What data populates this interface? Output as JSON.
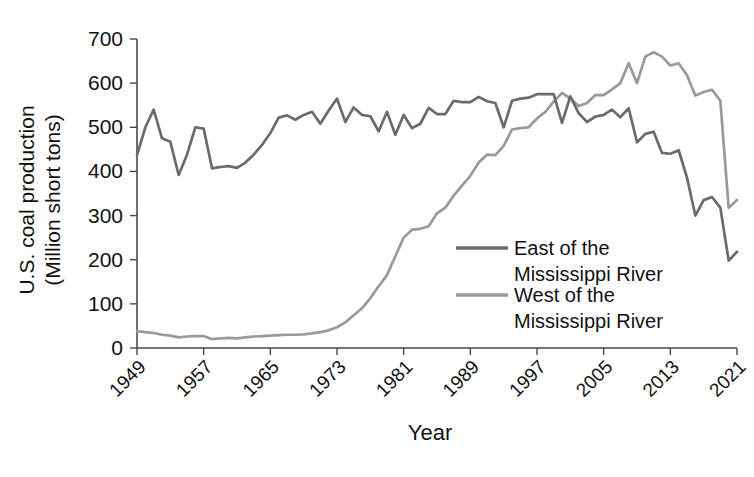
{
  "chart_data": {
    "type": "line",
    "title": "",
    "xlabel": "Year",
    "ylabel": "U.S. coal production (Million short tons)",
    "ylabel_line1": "U.S. coal production",
    "ylabel_line2": "(Million short tons)",
    "ylim": [
      0,
      700
    ],
    "ytick_labels": [
      "0",
      "100",
      "200",
      "300",
      "400",
      "500",
      "600",
      "700"
    ],
    "ytick_values": [
      0,
      100,
      200,
      300,
      400,
      500,
      600,
      700
    ],
    "xlim": [
      1949,
      2021
    ],
    "xtick_labels": [
      "1949",
      "1957",
      "1965",
      "1973",
      "1981",
      "1989",
      "1997",
      "2005",
      "2013",
      "2021"
    ],
    "xtick_values": [
      1949,
      1957,
      1965,
      1973,
      1981,
      1989,
      1997,
      2005,
      2013,
      2021
    ],
    "grid": false,
    "legend_position": "center-right",
    "x": [
      1949,
      1950,
      1951,
      1952,
      1953,
      1954,
      1955,
      1956,
      1957,
      1958,
      1959,
      1960,
      1961,
      1962,
      1963,
      1964,
      1965,
      1966,
      1967,
      1968,
      1969,
      1970,
      1971,
      1972,
      1973,
      1974,
      1975,
      1976,
      1977,
      1978,
      1979,
      1980,
      1981,
      1982,
      1983,
      1984,
      1985,
      1986,
      1987,
      1988,
      1989,
      1990,
      1991,
      1992,
      1993,
      1994,
      1995,
      1996,
      1997,
      1998,
      1999,
      2000,
      2001,
      2002,
      2003,
      2004,
      2005,
      2006,
      2007,
      2008,
      2009,
      2010,
      2011,
      2012,
      2013,
      2014,
      2015,
      2016,
      2017,
      2018,
      2019,
      2020,
      2021
    ],
    "series": [
      {
        "name": "East of the Mississippi River",
        "color": "#6b6b6b",
        "values": [
          437,
          500,
          540,
          475,
          467,
          392,
          438,
          500,
          497,
          407,
          410,
          412,
          408,
          420,
          438,
          460,
          487,
          522,
          527,
          517,
          528,
          535,
          508,
          538,
          565,
          512,
          545,
          528,
          525,
          491,
          535,
          483,
          528,
          498,
          508,
          544,
          530,
          530,
          560,
          557,
          557,
          569,
          559,
          555,
          500,
          560,
          565,
          567,
          575,
          575,
          575,
          510,
          570,
          532,
          512,
          524,
          528,
          540,
          523,
          543,
          466,
          485,
          490,
          442,
          440,
          448,
          386,
          300,
          335,
          342,
          318,
          198,
          218
        ]
      },
      {
        "name": "West of the Mississippi River",
        "color": "#9a9a9a",
        "values": [
          38,
          36,
          34,
          30,
          28,
          24,
          26,
          27,
          27,
          20,
          22,
          23,
          22,
          24,
          26,
          27,
          28,
          29,
          30,
          30,
          31,
          33,
          36,
          40,
          47,
          58,
          74,
          90,
          113,
          140,
          165,
          208,
          250,
          268,
          270,
          276,
          305,
          318,
          345,
          368,
          390,
          420,
          438,
          437,
          458,
          495,
          498,
          500,
          520,
          535,
          558,
          578,
          565,
          548,
          555,
          573,
          573,
          586,
          600,
          645,
          600,
          660,
          670,
          660,
          640,
          645,
          618,
          572,
          580,
          585,
          560,
          318,
          335
        ]
      }
    ]
  },
  "legend": {
    "items": [
      {
        "label_line1": "East of the",
        "label_line2": "Mississippi River",
        "color": "#6b6b6b"
      },
      {
        "label_line1": "West of the",
        "label_line2": "Mississippi River",
        "color": "#9a9a9a"
      }
    ]
  },
  "colors": {
    "east": "#6b6b6b",
    "west": "#9a9a9a",
    "axis": "#4a4a4a",
    "text": "#111111",
    "background": "#ffffff"
  }
}
